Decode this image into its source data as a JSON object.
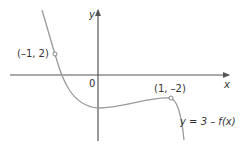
{
  "diagram": {
    "axes": {
      "x_label": "x",
      "y_label": "y",
      "origin_label": "0"
    },
    "points": [
      {
        "label": "(–1, 2)",
        "x": -1,
        "y": 2
      },
      {
        "label": "(1, –2)",
        "x": 1,
        "y": -2
      }
    ],
    "curve_label": "y = 3 – f(x)",
    "colors": {
      "axis": "#555555",
      "curve": "#9a9a9a",
      "text": "#333333"
    }
  }
}
